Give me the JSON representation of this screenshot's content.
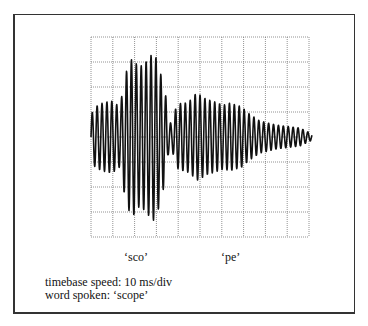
{
  "figure": {
    "grid": {
      "x0": 91,
      "y0": 37,
      "width": 218,
      "height": 200,
      "cols": 10,
      "rows": 8,
      "color": "#777777"
    },
    "waveform": {
      "color": "#111111",
      "centre_y": 137,
      "start_x": 91,
      "end_x": 312,
      "period_px": 4.9,
      "envelope": [
        [
          91,
          22
        ],
        [
          95,
          30
        ],
        [
          100,
          33
        ],
        [
          106,
          35
        ],
        [
          112,
          36
        ],
        [
          116,
          33
        ],
        [
          120,
          30
        ],
        [
          124,
          55
        ],
        [
          128,
          72
        ],
        [
          133,
          80
        ],
        [
          138,
          70
        ],
        [
          143,
          72
        ],
        [
          148,
          78
        ],
        [
          153,
          84
        ],
        [
          157,
          78
        ],
        [
          162,
          58
        ],
        [
          166,
          40
        ],
        [
          168,
          18
        ],
        [
          172,
          12
        ],
        [
          176,
          30
        ],
        [
          181,
          34
        ],
        [
          186,
          34
        ],
        [
          192,
          38
        ],
        [
          196,
          44
        ],
        [
          200,
          42
        ],
        [
          206,
          38
        ],
        [
          212,
          36
        ],
        [
          218,
          34
        ],
        [
          224,
          32
        ],
        [
          230,
          34
        ],
        [
          236,
          32
        ],
        [
          242,
          30
        ],
        [
          248,
          24
        ],
        [
          254,
          20
        ],
        [
          260,
          16
        ],
        [
          268,
          14
        ],
        [
          276,
          12
        ],
        [
          284,
          11
        ],
        [
          292,
          10
        ],
        [
          300,
          9
        ],
        [
          306,
          6
        ],
        [
          312,
          3
        ]
      ]
    },
    "labels": {
      "syllable_1": "‘sco’",
      "syllable_2": "‘pe’"
    },
    "caption": {
      "line_1": "timebase speed: 10 ms/div",
      "line_2": "word spoken: ‘scope’"
    }
  }
}
